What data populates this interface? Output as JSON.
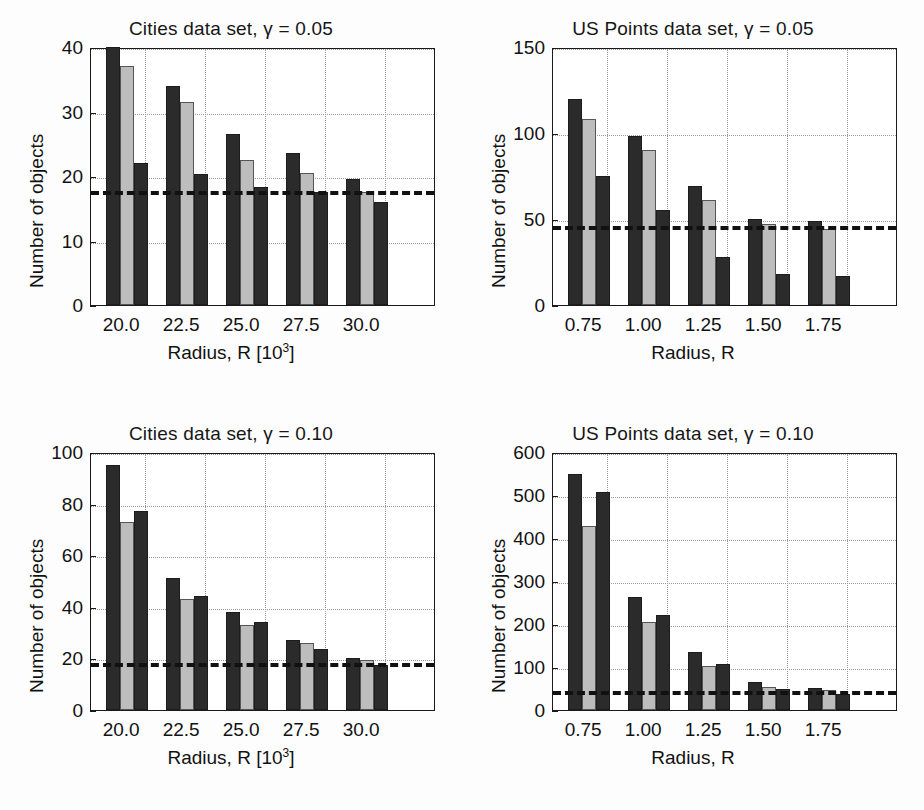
{
  "figure": {
    "background_color": "#fdfdfd",
    "series_colors": [
      "#2b2b2b",
      "#bdbdbd",
      "#2b2b2b"
    ]
  },
  "chart_data": [
    {
      "type": "bar",
      "panel": "top-left",
      "title": "Cities data set, γ = 0.05",
      "xlabel": "Radius, R [10³]",
      "xlabel_base": "Radius, R [10",
      "xlabel_sup": "3",
      "xlabel_tail": "]",
      "ylabel": "Number of objects",
      "categories": [
        "20.0",
        "22.5",
        "25.0",
        "27.5",
        "30.0"
      ],
      "series": [
        {
          "name": "series-1",
          "values": [
            40,
            34,
            26.5,
            23.5,
            19.5
          ]
        },
        {
          "name": "series-2",
          "values": [
            37,
            31.5,
            22.5,
            20.5,
            17.5
          ]
        },
        {
          "name": "series-3",
          "values": [
            22,
            20.3,
            18.3,
            17.5,
            16
          ]
        }
      ],
      "yticks": [
        0,
        10,
        20,
        30,
        40
      ],
      "ylim": [
        0,
        40
      ],
      "reference_line": 18,
      "grid": true,
      "legend": "none"
    },
    {
      "type": "bar",
      "panel": "top-right",
      "title": "US Points data set, γ = 0.05",
      "xlabel": "Radius, R",
      "ylabel": "Number of objects",
      "categories": [
        "0.75",
        "1.00",
        "1.25",
        "1.50",
        "1.75"
      ],
      "series": [
        {
          "name": "series-1",
          "values": [
            120,
            98,
            69,
            50,
            49
          ]
        },
        {
          "name": "series-2",
          "values": [
            108,
            90,
            61,
            47,
            44
          ]
        },
        {
          "name": "series-3",
          "values": [
            75,
            55,
            28,
            18,
            17
          ]
        }
      ],
      "yticks": [
        0,
        50,
        100,
        150
      ],
      "ylim": [
        0,
        150
      ],
      "reference_line": 47,
      "grid": true,
      "legend": "none"
    },
    {
      "type": "bar",
      "panel": "bottom-left",
      "title": "Cities data set, γ = 0.10",
      "xlabel": "Radius, R [10³]",
      "xlabel_base": "Radius, R [10",
      "xlabel_sup": "3",
      "xlabel_tail": "]",
      "ylabel": "Number of objects",
      "categories": [
        "20.0",
        "22.5",
        "25.0",
        "27.5",
        "30.0"
      ],
      "series": [
        {
          "name": "series-1",
          "values": [
            95,
            51,
            38,
            27,
            20
          ]
        },
        {
          "name": "series-2",
          "values": [
            73,
            43,
            33,
            26,
            19.5
          ]
        },
        {
          "name": "series-3",
          "values": [
            77,
            44,
            34,
            23.5,
            17.5
          ]
        }
      ],
      "yticks": [
        0,
        20,
        40,
        60,
        80,
        100
      ],
      "ylim": [
        0,
        100
      ],
      "reference_line": 19,
      "grid": true,
      "legend": "none"
    },
    {
      "type": "bar",
      "panel": "bottom-right",
      "title": "US Points data set, γ = 0.10",
      "xlabel": "Radius, R",
      "ylabel": "Number of objects",
      "categories": [
        "0.75",
        "1.00",
        "1.25",
        "1.50",
        "1.75"
      ],
      "series": [
        {
          "name": "series-1",
          "values": [
            550,
            262,
            135,
            66,
            52
          ]
        },
        {
          "name": "series-2",
          "values": [
            427,
            205,
            102,
            54,
            46
          ]
        },
        {
          "name": "series-3",
          "values": [
            507,
            222,
            107,
            48,
            37
          ]
        }
      ],
      "yticks": [
        0,
        100,
        200,
        300,
        400,
        500,
        600
      ],
      "ylim": [
        0,
        600
      ],
      "reference_line": 50,
      "grid": true,
      "legend": "none"
    }
  ]
}
